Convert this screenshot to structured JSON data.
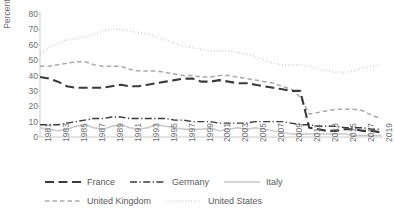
{
  "chart_data": {
    "type": "line",
    "title": "",
    "xlabel": "",
    "ylabel": "Percent",
    "ylim": [
      0,
      80
    ],
    "ytick_step": 10,
    "yticks": [
      "80",
      "70",
      "60",
      "50",
      "40",
      "30",
      "20",
      "10",
      "0"
    ],
    "grid": false,
    "legend_position": "bottom",
    "x": [
      1981,
      1982,
      1983,
      1984,
      1985,
      1986,
      1987,
      1988,
      1989,
      1990,
      1991,
      1992,
      1993,
      1994,
      1995,
      1996,
      1997,
      1998,
      1999,
      2000,
      2001,
      2002,
      2003,
      2004,
      2005,
      2006,
      2007,
      2008,
      2009,
      2010,
      2011,
      2012,
      2013,
      2014,
      2015,
      2016,
      2017,
      2018,
      2019
    ],
    "xtick_labels": [
      "1981",
      "1983",
      "1985",
      "1987",
      "1989",
      "1991",
      "1993",
      "1995",
      "1997",
      "1999",
      "2001",
      "2003",
      "2005",
      "2007",
      "2009",
      "2011",
      "2013",
      "2015",
      "2017",
      "2019"
    ],
    "series": [
      {
        "name": "France",
        "style": "long-dash",
        "color": "#3b3b3d",
        "width": 2.1,
        "values": [
          39,
          38,
          36,
          33,
          32,
          32,
          32,
          32,
          33,
          34,
          33,
          33,
          34,
          35,
          36,
          37,
          38,
          38,
          36,
          36,
          37,
          36,
          35,
          35,
          34,
          33,
          32,
          31,
          30,
          30,
          6,
          5,
          4,
          4,
          5,
          5,
          4,
          4,
          3
        ]
      },
      {
        "name": "Germany",
        "style": "dash-dot",
        "color": "#3b3b3d",
        "width": 1.4,
        "values": [
          8,
          8,
          8,
          9,
          10,
          11,
          12,
          12,
          13,
          13,
          12,
          12,
          12,
          12,
          12,
          11,
          11,
          10,
          10,
          10,
          9,
          9,
          9,
          9,
          10,
          10,
          10,
          10,
          9,
          8,
          8,
          7,
          7,
          7,
          6,
          6,
          6,
          5,
          5
        ]
      },
      {
        "name": "Italy",
        "style": "solid",
        "color": "#c6c7c9",
        "width": 1.4,
        "values": [
          6,
          5,
          4,
          5,
          7,
          8,
          6,
          5,
          7,
          8,
          6,
          5,
          6,
          8,
          7,
          6,
          5,
          5,
          5,
          6,
          4,
          5,
          6,
          5,
          6,
          5,
          4,
          3,
          2,
          2,
          2,
          2,
          2,
          2,
          2,
          1,
          1,
          1,
          1
        ]
      },
      {
        "name": "United Kingdom",
        "style": "dash",
        "color": "#a7a9ac",
        "width": 1.5,
        "values": [
          46,
          46,
          47,
          48,
          49,
          49,
          47,
          46,
          46,
          46,
          44,
          43,
          43,
          43,
          42,
          41,
          40,
          40,
          39,
          39,
          40,
          40,
          39,
          38,
          37,
          36,
          35,
          33,
          31,
          26,
          15,
          16,
          17,
          18,
          18,
          18,
          17,
          14,
          12
        ]
      },
      {
        "name": "United States",
        "style": "dot",
        "color": "#bcbec0",
        "width": 1.6,
        "values": [
          54,
          58,
          61,
          63,
          64,
          65,
          67,
          69,
          70,
          70,
          69,
          68,
          67,
          65,
          63,
          61,
          59,
          58,
          57,
          56,
          56,
          56,
          55,
          54,
          52,
          50,
          48,
          47,
          47,
          47,
          46,
          44,
          43,
          42,
          42,
          43,
          45,
          46,
          47
        ]
      }
    ]
  },
  "axis": {
    "y_title": "Percent"
  },
  "legend": {
    "rows": [
      [
        {
          "label": "France",
          "key": "France"
        },
        {
          "label": "Germany",
          "key": "Germany"
        },
        {
          "label": "Italy",
          "key": "Italy"
        }
      ],
      [
        {
          "label": "United Kingdom",
          "key": "United Kingdom"
        },
        {
          "label": "United States",
          "key": "United States"
        }
      ]
    ]
  },
  "colors": {
    "axis": "#c9cacc",
    "text": "#6d6e71",
    "france": "#3b3b3d",
    "germany": "#3b3b3d",
    "italy": "#c6c7c9",
    "uk": "#a7a9ac",
    "us": "#bcbec0",
    "background": "#ffffff"
  }
}
